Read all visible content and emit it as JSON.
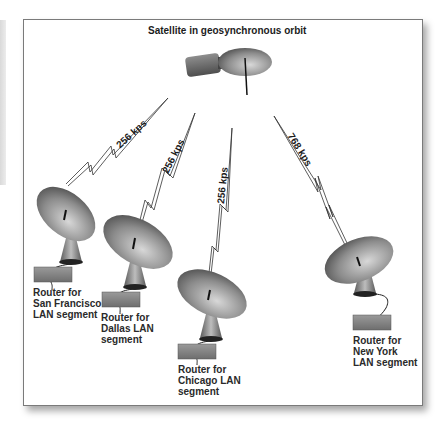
{
  "title": "Satellite in geosynchronous orbit",
  "colors": {
    "frame_border": "#7a7a7a",
    "dish_dark": "#555555",
    "dish_light": "#c8c8c8",
    "router_fill": "#8a8a8a",
    "text": "#1c1c1c"
  },
  "satellite": {
    "label": "Satellite in geosynchronous orbit",
    "icon": "satellite-icon"
  },
  "links": [
    {
      "id": "sf",
      "speed": "256 kps"
    },
    {
      "id": "dallas",
      "speed": "256 kps"
    },
    {
      "id": "chicago",
      "speed": "256 kps"
    },
    {
      "id": "newyork",
      "speed": "768 kps"
    }
  ],
  "sites": [
    {
      "id": "sf",
      "label_lines": [
        "Router for",
        "San Francisco",
        "LAN segment"
      ],
      "icon": "satellite-dish-icon",
      "router_icon": "router-icon"
    },
    {
      "id": "dallas",
      "label_lines": [
        "Router for",
        "Dallas LAN",
        "segment"
      ],
      "icon": "satellite-dish-icon",
      "router_icon": "router-icon"
    },
    {
      "id": "chicago",
      "label_lines": [
        "Router for",
        "Chicago LAN",
        "segment"
      ],
      "icon": "satellite-dish-icon",
      "router_icon": "router-icon"
    },
    {
      "id": "newyork",
      "label_lines": [
        "Router for",
        "New York",
        "LAN segment"
      ],
      "icon": "satellite-dish-icon",
      "router_icon": "router-icon"
    }
  ]
}
